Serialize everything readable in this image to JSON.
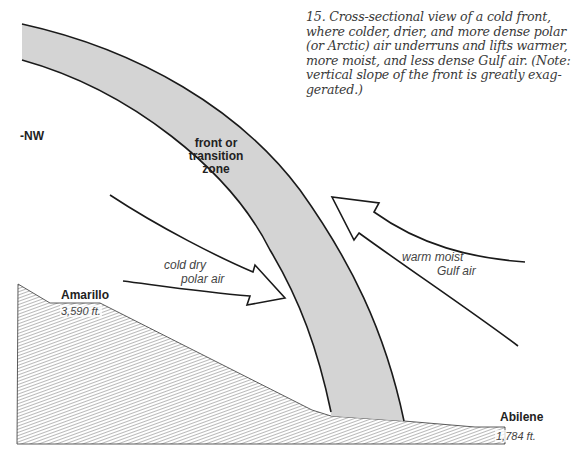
{
  "caption": {
    "number": "15.",
    "lines": [
      "15. Cross-sectional view of a cold front,",
      "where colder, drier, and more dense polar",
      "(or Arctic) air underruns and lifts warmer,",
      "more moist, and less dense Gulf air. (Note:",
      "vertical slope of the front is greatly exag-",
      "gerated.)"
    ]
  },
  "labels": {
    "direction": "-NW",
    "front": [
      "front or",
      "transition",
      "zone"
    ],
    "cold_air": [
      "cold dry",
      "polar air"
    ],
    "warm_air": [
      "warm moist",
      "Gulf air"
    ]
  },
  "locations": [
    {
      "name": "Amarillo",
      "elevation": "3,590 ft."
    },
    {
      "name": "Abilene",
      "elevation": "1,784 ft."
    }
  ],
  "colors": {
    "front_fill": "#d4d4d4",
    "outline": "#1a1a1a",
    "hatch": "#8a8a8a",
    "text": "#333333"
  }
}
